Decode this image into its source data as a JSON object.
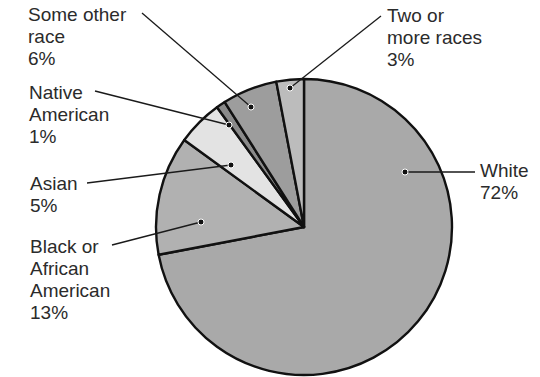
{
  "chart_data": {
    "type": "pie",
    "title": "",
    "start_angle_deg": 0,
    "direction": "clockwise",
    "slices": [
      {
        "label": "White",
        "value": 72,
        "display": "72%",
        "color": "#a9a9a9"
      },
      {
        "label": "Black or African American",
        "value": 13,
        "display": "13%",
        "color": "#b1b1b1"
      },
      {
        "label": "Asian",
        "value": 5,
        "display": "5%",
        "color": "#e3e3e3"
      },
      {
        "label": "Native American",
        "value": 1,
        "display": "1%",
        "color": "#8a8a8a"
      },
      {
        "label": "Some other race",
        "value": 6,
        "display": "6%",
        "color": "#9d9d9d"
      },
      {
        "label": "Two or more races",
        "value": 3,
        "display": "3%",
        "color": "#bcbcbc"
      }
    ],
    "legend": "callout labels with leader lines"
  },
  "labels": {
    "white": {
      "lines": [
        "White",
        "72%"
      ]
    },
    "black": {
      "lines": [
        "Black or",
        "African",
        "American",
        "13%"
      ]
    },
    "asian": {
      "lines": [
        "Asian",
        "5%"
      ]
    },
    "native": {
      "lines": [
        "Native",
        "American",
        "1%"
      ]
    },
    "other": {
      "lines": [
        "Some other",
        "race",
        "6%"
      ]
    },
    "two": {
      "lines": [
        "Two or",
        "more races",
        "3%"
      ]
    }
  }
}
